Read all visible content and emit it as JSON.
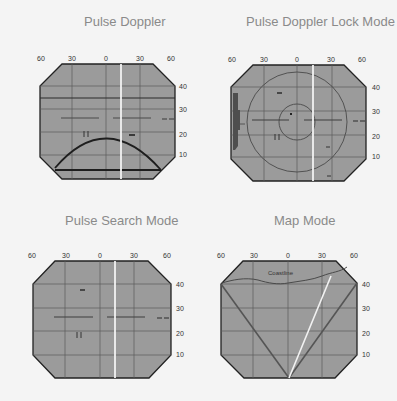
{
  "panels": [
    {
      "id": "pulse-doppler",
      "title": "Pulse Doppler",
      "top_axis_labels": [
        "60",
        "30",
        "0",
        "30",
        "60"
      ],
      "right_axis_labels": [
        "40",
        "30",
        "20",
        "10"
      ]
    },
    {
      "id": "pulse-doppler-lock-mode",
      "title": "Pulse Doppler Lock Mode",
      "top_axis_labels": [
        "60",
        "30",
        "0",
        "30",
        "60"
      ],
      "right_axis_labels": [
        "40",
        "30",
        "20",
        "10"
      ]
    },
    {
      "id": "pulse-search-mode",
      "title": "Pulse Search Mode",
      "top_axis_labels": [
        "60",
        "30",
        "0",
        "30",
        "60"
      ],
      "right_axis_labels": [
        "40",
        "30",
        "20",
        "10"
      ]
    },
    {
      "id": "map-mode",
      "title": "Map Mode",
      "top_axis_labels": [
        "60",
        "30",
        "0",
        "30",
        "60"
      ],
      "right_axis_labels": [
        "40",
        "30",
        "20",
        "10"
      ],
      "annotation": "Coastline"
    }
  ],
  "colors": {
    "background": "#f4f4f4",
    "scope_fill": "#9b9b9b",
    "grid": "#5a5a5a",
    "outline": "#222222",
    "cursor": "#f2f2f2",
    "title": "#8a8a8a"
  }
}
